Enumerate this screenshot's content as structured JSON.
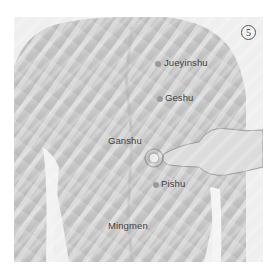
{
  "figure": {
    "step_badge": "5",
    "acupoints": [
      {
        "name": "Jueyinshu",
        "label": "Jueyinshu"
      },
      {
        "name": "Geshu",
        "label": "Geshu"
      },
      {
        "name": "Ganshu",
        "label": "Ganshu"
      },
      {
        "name": "Pishu",
        "label": "Pishu"
      },
      {
        "name": "Mingmen",
        "label": "Mingmen"
      }
    ],
    "colors": {
      "background": "#ffffff",
      "skin_light": "#d8d8d8",
      "skin_dark": "#a9a9a9",
      "label_text": "#3f3f3f",
      "dot": "#9a9a9a"
    }
  }
}
